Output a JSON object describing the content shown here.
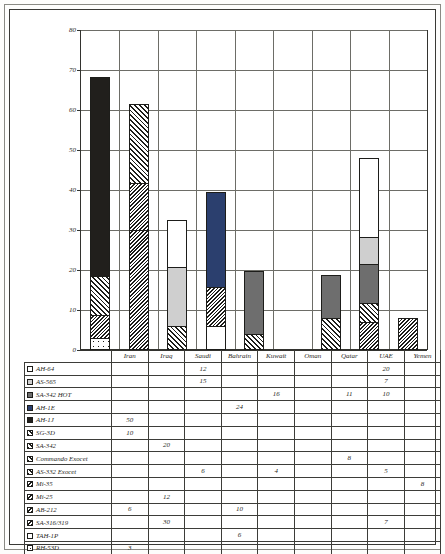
{
  "chart_data": {
    "type": "bar",
    "stacked": true,
    "title": "",
    "subtitle": "",
    "xlabel": "",
    "ylabel": "",
    "ylim": [
      0,
      80
    ],
    "yticks": [
      0,
      10,
      20,
      30,
      40,
      50,
      60,
      70,
      80
    ],
    "grid": true,
    "legend_position": "table-below",
    "categories": [
      "Iran",
      "Iraq",
      "Saudi",
      "Bahrain",
      "Kuwait",
      "Oman",
      "Qatar",
      "UAE",
      "Yemen"
    ],
    "series": [
      {
        "name": "AH-64",
        "pattern": "white",
        "values": [
          0,
          0,
          12,
          0,
          0,
          0,
          0,
          20,
          0
        ]
      },
      {
        "name": "AS-565",
        "pattern": "ltgray",
        "values": [
          0,
          0,
          15,
          0,
          0,
          0,
          0,
          7,
          0
        ]
      },
      {
        "name": "SA-342 HOT",
        "pattern": "dkgray",
        "values": [
          0,
          0,
          0,
          0,
          16,
          0,
          11,
          10,
          0
        ]
      },
      {
        "name": "AH-1E",
        "pattern": "darkblue",
        "values": [
          0,
          0,
          0,
          24,
          0,
          0,
          0,
          0,
          0
        ]
      },
      {
        "name": "AH-1J",
        "pattern": "black",
        "values": [
          50,
          0,
          0,
          0,
          0,
          0,
          0,
          0,
          0
        ]
      },
      {
        "name": "SG-3D",
        "pattern": "hatch",
        "values": [
          10,
          0,
          0,
          0,
          0,
          0,
          0,
          0,
          0
        ]
      },
      {
        "name": "SA-342",
        "pattern": "hatch",
        "values": [
          0,
          20,
          0,
          0,
          0,
          0,
          0,
          0,
          0
        ]
      },
      {
        "name": "Commando Exocet",
        "pattern": "hatch",
        "values": [
          0,
          0,
          0,
          0,
          0,
          0,
          8,
          0,
          0
        ]
      },
      {
        "name": "AS-332 Exocet",
        "pattern": "hatch",
        "values": [
          0,
          0,
          6,
          0,
          4,
          0,
          0,
          5,
          0
        ]
      },
      {
        "name": "Mi-35",
        "pattern": "hatchdense",
        "values": [
          0,
          0,
          0,
          0,
          0,
          0,
          0,
          0,
          8
        ]
      },
      {
        "name": "Mi-25",
        "pattern": "hatchdense",
        "values": [
          0,
          12,
          0,
          0,
          0,
          0,
          0,
          0,
          0
        ]
      },
      {
        "name": "AB-212",
        "pattern": "hatchdense",
        "values": [
          6,
          0,
          0,
          10,
          0,
          0,
          0,
          0,
          0
        ]
      },
      {
        "name": "SA-316/319",
        "pattern": "hatchdense",
        "values": [
          0,
          30,
          0,
          0,
          0,
          0,
          0,
          7,
          0
        ]
      },
      {
        "name": "TAH-1P",
        "pattern": "white",
        "values": [
          0,
          0,
          0,
          6,
          0,
          0,
          0,
          0,
          0
        ]
      },
      {
        "name": "RH-53D",
        "pattern": "dots",
        "values": [
          3,
          0,
          0,
          0,
          0,
          0,
          0,
          0,
          0
        ]
      }
    ],
    "totals": [
      69,
      62,
      33,
      40,
      20,
      0,
      19,
      49,
      8
    ]
  },
  "yaxis": {
    "ticks": [
      "0",
      "10",
      "20",
      "30",
      "40",
      "50",
      "60",
      "70",
      "80"
    ]
  },
  "countries": [
    "Iran",
    "Iraq",
    "Saudi",
    "Bahrain",
    "Kuwait",
    "Oman",
    "Qatar",
    "UAE",
    "Yemen"
  ],
  "table": {
    "rows": [
      {
        "label": "AH-64",
        "swatch": "white",
        "cells": [
          "",
          "",
          "12",
          "",
          "",
          "",
          "",
          "20",
          ""
        ]
      },
      {
        "label": "AS-565",
        "swatch": "ltgray",
        "cells": [
          "",
          "",
          "15",
          "",
          "",
          "",
          "",
          "7",
          ""
        ]
      },
      {
        "label": "SA-342 HOT",
        "swatch": "dkgray",
        "cells": [
          "",
          "",
          "",
          "",
          "16",
          "",
          "11",
          "10",
          ""
        ]
      },
      {
        "label": "AH-1E",
        "swatch": "darkblue",
        "cells": [
          "",
          "",
          "",
          "24",
          "",
          "",
          "",
          "",
          ""
        ]
      },
      {
        "label": "AH-1J",
        "swatch": "black",
        "cells": [
          "50",
          "",
          "",
          "",
          "",
          "",
          "",
          "",
          ""
        ]
      },
      {
        "label": "SG-3D",
        "swatch": "hatch",
        "cells": [
          "10",
          "",
          "",
          "",
          "",
          "",
          "",
          "",
          ""
        ]
      },
      {
        "label": "SA-342",
        "swatch": "hatch",
        "cells": [
          "",
          "20",
          "",
          "",
          "",
          "",
          "",
          "",
          ""
        ]
      },
      {
        "label": "Commando Exocet",
        "swatch": "hatch",
        "cells": [
          "",
          "",
          "",
          "",
          "",
          "",
          "8",
          "",
          ""
        ]
      },
      {
        "label": "AS-332 Exocet",
        "swatch": "hatch",
        "cells": [
          "",
          "",
          "6",
          "",
          "4",
          "",
          "",
          "5",
          ""
        ]
      },
      {
        "label": "Mi-35",
        "swatch": "hatchdense",
        "cells": [
          "",
          "",
          "",
          "",
          "",
          "",
          "",
          "",
          "8"
        ]
      },
      {
        "label": "Mi-25",
        "swatch": "hatchdense",
        "cells": [
          "",
          "12",
          "",
          "",
          "",
          "",
          "",
          "",
          ""
        ]
      },
      {
        "label": "AB-212",
        "swatch": "hatchdense",
        "cells": [
          "6",
          "",
          "",
          "10",
          "",
          "",
          "",
          "",
          ""
        ]
      },
      {
        "label": "SA-316/319",
        "swatch": "hatchdense",
        "cells": [
          "",
          "30",
          "",
          "",
          "",
          "",
          "",
          "7",
          ""
        ]
      },
      {
        "label": "TAH-1P",
        "swatch": "white",
        "cells": [
          "",
          "",
          "",
          "6",
          "",
          "",
          "",
          "",
          ""
        ]
      },
      {
        "label": "RH-53D",
        "swatch": "dots",
        "cells": [
          "3",
          "",
          "",
          "",
          "",
          "",
          "",
          "",
          ""
        ]
      }
    ]
  },
  "colors": {
    "white": "#ffffff",
    "ltgray": "#cfcfcf",
    "dkgray": "#6e6e6e",
    "black": "#211f1c",
    "darkblue": "#2b3f6e",
    "outline": "#1d1d1a",
    "grid": "#6d6d67"
  }
}
